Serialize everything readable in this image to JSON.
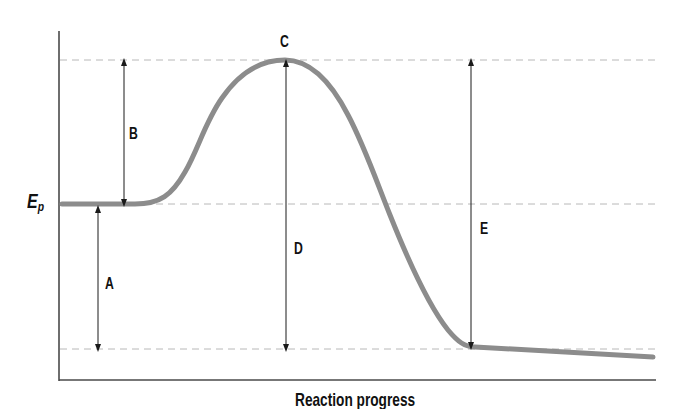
{
  "diagram": {
    "type": "potential-energy-diagram",
    "x_axis_label": "Reaction progress",
    "y_axis_label": {
      "main": "E",
      "subscript": "p"
    },
    "segment_labels": {
      "A": "A",
      "B": "B",
      "C": "C",
      "D": "D",
      "E": "E"
    },
    "levels": {
      "activated_complex_y": 60,
      "reactants_y": 204,
      "products_y": 349
    },
    "colors": {
      "curve": "#8c8c8c",
      "axis": "#4a4a4a",
      "guides": "#b8b8b8",
      "arrows": "#1a1a1a",
      "text": "#111111"
    },
    "annotations": [
      {
        "id": "A",
        "description": "Vertical double arrow from products level to reactants level"
      },
      {
        "id": "B",
        "description": "Vertical double arrow from reactants level to peak level"
      },
      {
        "id": "C",
        "description": "Label at top of curve (peak)"
      },
      {
        "id": "D",
        "description": "Vertical double arrow from peak to products level, under peak"
      },
      {
        "id": "E",
        "description": "Vertical double arrow from products level to peak level, right side"
      }
    ]
  }
}
